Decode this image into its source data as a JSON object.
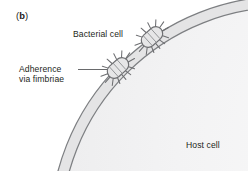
{
  "figure": {
    "panel_label": "(b)",
    "labels": {
      "bacterial_cell": "Bacterial cell",
      "adherence_line1": "Adherence",
      "adherence_line2": "via fimbriae",
      "host_cell": "Host cell"
    },
    "colors": {
      "background": "#ffffff",
      "text": "#231f20",
      "membrane_stroke": "#808285",
      "membrane_fill": "#e8e8e9",
      "cytoplasm_fill": "#f2f2f3",
      "bacteria_fill": "#e6e6e7",
      "bacteria_stroke": "#6d6e71",
      "leader_line": "#58595b"
    },
    "elements": {
      "host_cell_name": "host-cell",
      "membrane_name": "host-cell-membrane",
      "bacteria": [
        {
          "name": "bacterial-cell-upper",
          "cx": 152,
          "cy": 37,
          "rotation": -42
        },
        {
          "name": "bacterial-cell-lower",
          "cx": 118,
          "cy": 68,
          "rotation": -42
        }
      ],
      "fimbriae_count": 12
    }
  }
}
